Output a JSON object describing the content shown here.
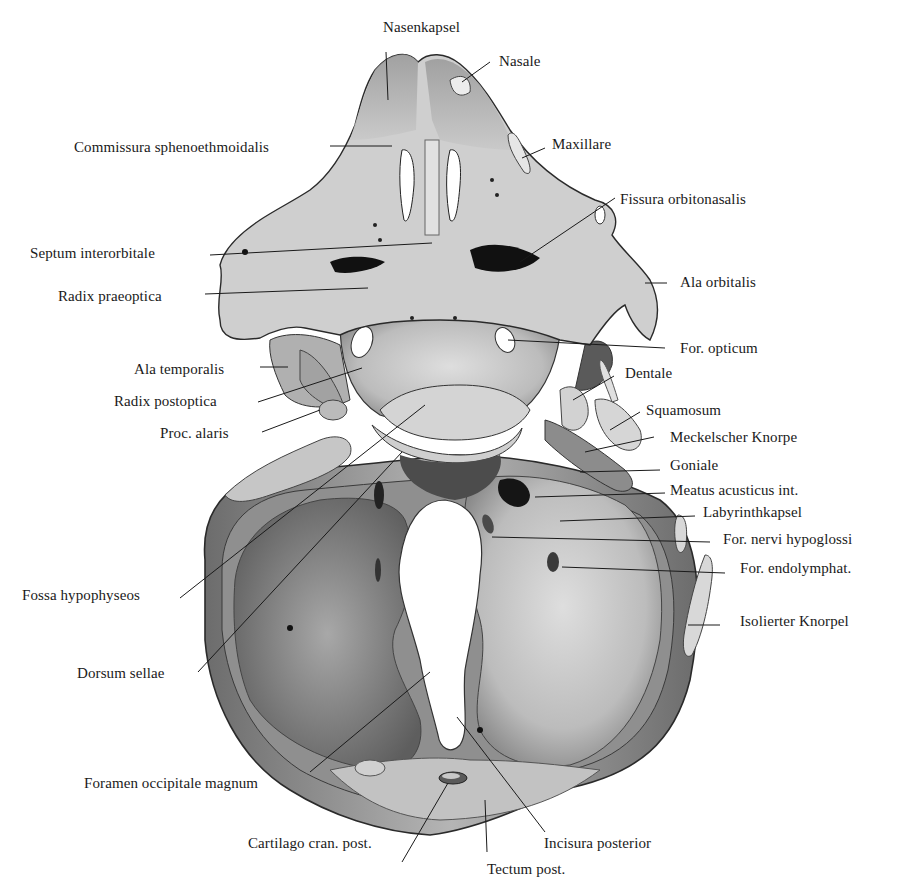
{
  "figure": {
    "background": "#ffffff",
    "ink_color": "#1a1a1a",
    "cartilage_light": "#d6d6d6",
    "cartilage_mid": "#9a9a9a",
    "cartilage_dark": "#5a5a5a"
  },
  "labels": {
    "top": [
      {
        "id": "nasenkapsel",
        "text": "Nasenkapsel"
      },
      {
        "id": "nasale",
        "text": "Nasale"
      }
    ],
    "left": [
      {
        "id": "commissura",
        "text": "Commissura sphenoethmoidalis"
      },
      {
        "id": "septum",
        "text": "Septum interorbitale"
      },
      {
        "id": "radix_prae",
        "text": "Radix praeoptica"
      },
      {
        "id": "ala_temp",
        "text": "Ala temporalis"
      },
      {
        "id": "radix_post",
        "text": "Radix postoptica"
      },
      {
        "id": "proc_alaris",
        "text": "Proc. alaris"
      },
      {
        "id": "fossa",
        "text": "Fossa hypophyseos"
      },
      {
        "id": "dorsum",
        "text": "Dorsum sellae"
      },
      {
        "id": "foramen_occ",
        "text": "Foramen occipitale magnum"
      }
    ],
    "right": [
      {
        "id": "maxillare",
        "text": "Maxillare"
      },
      {
        "id": "fissura",
        "text": "Fissura orbitonasalis"
      },
      {
        "id": "ala_orb",
        "text": "Ala orbitalis"
      },
      {
        "id": "for_opt",
        "text": "For. opticum"
      },
      {
        "id": "dentale",
        "text": "Dentale"
      },
      {
        "id": "squamosum",
        "text": "Squamosum"
      },
      {
        "id": "meckel",
        "text": "Meckelscher Knorpe"
      },
      {
        "id": "goniale",
        "text": "Goniale"
      },
      {
        "id": "meatus",
        "text": "Meatus acusticus int."
      },
      {
        "id": "labyrinth",
        "text": "Labyrinthkapsel"
      },
      {
        "id": "for_hypo",
        "text": "For. nervi hypoglossi"
      },
      {
        "id": "for_endo",
        "text": "For. endolymphat."
      },
      {
        "id": "isolierter",
        "text": "Isolierter Knorpel"
      }
    ],
    "bottom": [
      {
        "id": "cartilago",
        "text": "Cartilago cran. post."
      },
      {
        "id": "incisura",
        "text": "Incisura posterior"
      },
      {
        "id": "tectum",
        "text": "Tectum post."
      }
    ]
  }
}
